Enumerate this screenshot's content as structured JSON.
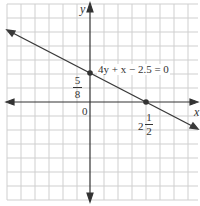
{
  "graph": {
    "equation_label": "4y + x − 2.5 = 0",
    "y_axis_label": "y",
    "x_axis_label": "x",
    "origin_label": "0",
    "y_intercept": {
      "numerator": "5",
      "denominator": "8"
    },
    "x_intercept": {
      "whole": "2",
      "numerator": "1",
      "denominator": "2"
    }
  },
  "colors": {
    "grid": "#cfcfcf",
    "axis": "#333333",
    "line": "#3a3a3a",
    "text": "#333333"
  }
}
